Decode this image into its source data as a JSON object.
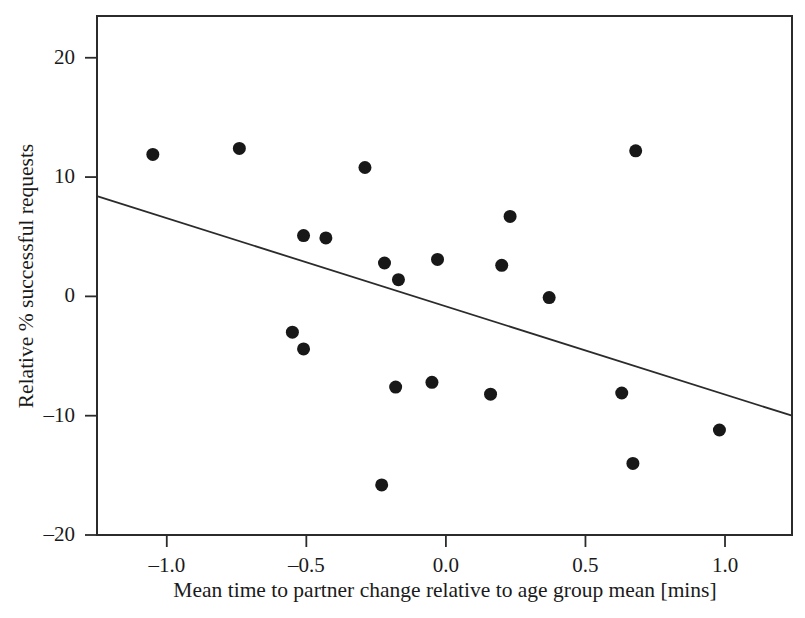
{
  "chart_data": {
    "type": "scatter",
    "title": "",
    "xlabel": "Mean time to partner change relative to age group mean [mins]",
    "ylabel": "Relative % successful requests",
    "xlim": [
      -1.25,
      1.24
    ],
    "ylim": [
      -20,
      23.5
    ],
    "grid": false,
    "legend": null,
    "xticks": [
      -1.0,
      -0.5,
      0.0,
      0.5,
      1.0
    ],
    "xticklabels": [
      "–1.0",
      "–0.5",
      "0.0",
      "0.5",
      "1.0"
    ],
    "yticks": [
      20,
      10,
      0,
      -10,
      -20
    ],
    "yticklabels": [
      "20",
      "10",
      "0",
      "–10",
      "–20"
    ],
    "marker": "filled-circle",
    "marker_color": "#181818",
    "marker_size_px": 13,
    "points": [
      {
        "x": -1.05,
        "y": 11.9
      },
      {
        "x": -0.74,
        "y": 12.4
      },
      {
        "x": -0.55,
        "y": -3.0
      },
      {
        "x": -0.51,
        "y": 5.1
      },
      {
        "x": -0.51,
        "y": -4.4
      },
      {
        "x": -0.43,
        "y": 4.9
      },
      {
        "x": -0.29,
        "y": 10.8
      },
      {
        "x": -0.23,
        "y": -15.8
      },
      {
        "x": -0.22,
        "y": 2.8
      },
      {
        "x": -0.18,
        "y": -7.6
      },
      {
        "x": -0.17,
        "y": 1.4
      },
      {
        "x": -0.05,
        "y": -7.2
      },
      {
        "x": -0.03,
        "y": 3.1
      },
      {
        "x": 0.16,
        "y": -8.2
      },
      {
        "x": 0.2,
        "y": 2.6
      },
      {
        "x": 0.23,
        "y": 6.7
      },
      {
        "x": 0.37,
        "y": -0.1
      },
      {
        "x": 0.63,
        "y": -8.1
      },
      {
        "x": 0.67,
        "y": -14.0
      },
      {
        "x": 0.68,
        "y": 12.2
      },
      {
        "x": 0.98,
        "y": -11.2
      }
    ],
    "trendline": {
      "type": "linear-fit",
      "x_start": -1.25,
      "y_start": 8.4,
      "x_end": 1.24,
      "y_end": -10.0,
      "color": "#2b2b2b"
    }
  }
}
